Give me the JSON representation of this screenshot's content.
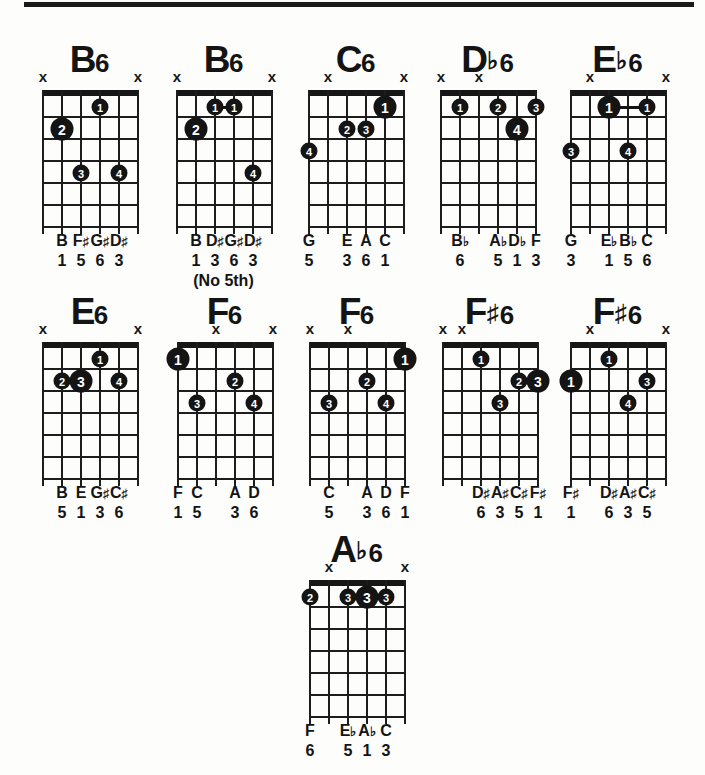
{
  "page": {
    "background": "#fdfdfc",
    "ink_color": "#141414",
    "muted_marker": "x",
    "strings_per_diagram": 6,
    "frets_per_diagram": 6
  },
  "diagrams": [
    {
      "id": "b6-open",
      "title": {
        "letter": "B",
        "accidental": "",
        "suffix": "6"
      },
      "grid_left": 42,
      "top": 42,
      "muted": [
        1,
        6
      ],
      "dots": [
        {
          "string": 4,
          "fret": 1,
          "finger": "1",
          "root": false
        },
        {
          "string": 2,
          "fret": 2,
          "finger": "2",
          "root": true
        },
        {
          "string": 3,
          "fret": 4,
          "finger": "3",
          "root": false
        },
        {
          "string": 5,
          "fret": 4,
          "finger": "4",
          "root": false
        }
      ],
      "barres": [],
      "notes": [
        "",
        "B",
        "F♯",
        "G♯",
        "D♯",
        ""
      ],
      "degrees": [
        "",
        "1",
        "5",
        "6",
        "3",
        ""
      ],
      "note_extra": ""
    },
    {
      "id": "b6-no5th",
      "title": {
        "letter": "B",
        "accidental": "",
        "suffix": "6"
      },
      "grid_left": 176,
      "top": 42,
      "muted": [
        1,
        6
      ],
      "dots": [
        {
          "string": 3,
          "fret": 1,
          "finger": "1",
          "root": false
        },
        {
          "string": 4,
          "fret": 1,
          "finger": "1",
          "root": false
        },
        {
          "string": 2,
          "fret": 2,
          "finger": "2",
          "root": true
        },
        {
          "string": 5,
          "fret": 4,
          "finger": "4",
          "root": false
        }
      ],
      "barres": [
        {
          "fret": 1,
          "from": 3,
          "to": 4
        }
      ],
      "notes": [
        "",
        "B",
        "D♯",
        "G♯",
        "D♯",
        ""
      ],
      "degrees": [
        "",
        "1",
        "3",
        "6",
        "3",
        ""
      ],
      "note_extra": "(No 5th)"
    },
    {
      "id": "c6",
      "title": {
        "letter": "C",
        "accidental": "",
        "suffix": "6"
      },
      "grid_left": 308,
      "top": 42,
      "muted": [
        2,
        6
      ],
      "dots": [
        {
          "string": 5,
          "fret": 1,
          "finger": "1",
          "root": true
        },
        {
          "string": 3,
          "fret": 2,
          "finger": "2",
          "root": false
        },
        {
          "string": 4,
          "fret": 2,
          "finger": "3",
          "root": false
        },
        {
          "string": 1,
          "fret": 3,
          "finger": "4",
          "root": false
        }
      ],
      "barres": [],
      "notes": [
        "G",
        "",
        "E",
        "A",
        "C",
        ""
      ],
      "degrees": [
        "5",
        "",
        "3",
        "6",
        "1",
        ""
      ],
      "note_extra": ""
    },
    {
      "id": "db6",
      "title": {
        "letter": "D",
        "accidental": "♭",
        "suffix": "6"
      },
      "grid_left": 440,
      "top": 42,
      "muted": [
        1,
        3
      ],
      "dots": [
        {
          "string": 2,
          "fret": 1,
          "finger": "1",
          "root": false
        },
        {
          "string": 4,
          "fret": 1,
          "finger": "2",
          "root": false
        },
        {
          "string": 6,
          "fret": 1,
          "finger": "3",
          "root": false
        },
        {
          "string": 5,
          "fret": 2,
          "finger": "4",
          "root": true
        }
      ],
      "barres": [],
      "notes": [
        "",
        "B♭",
        "",
        "A♭",
        "D♭",
        "F"
      ],
      "degrees": [
        "",
        "6",
        "",
        "5",
        "1",
        "3"
      ],
      "note_extra": ""
    },
    {
      "id": "eb6",
      "title": {
        "letter": "E",
        "accidental": "♭",
        "suffix": "6"
      },
      "grid_left": 570,
      "top": 42,
      "muted": [
        2,
        6
      ],
      "dots": [
        {
          "string": 3,
          "fret": 1,
          "finger": "1",
          "root": true
        },
        {
          "string": 5,
          "fret": 1,
          "finger": "1",
          "root": false
        },
        {
          "string": 1,
          "fret": 3,
          "finger": "3",
          "root": false
        },
        {
          "string": 4,
          "fret": 3,
          "finger": "4",
          "root": false
        }
      ],
      "barres": [
        {
          "fret": 1,
          "from": 3,
          "to": 5
        }
      ],
      "notes": [
        "G",
        "",
        "E♭",
        "B♭",
        "C",
        ""
      ],
      "degrees": [
        "3",
        "",
        "1",
        "5",
        "6",
        ""
      ],
      "note_extra": ""
    },
    {
      "id": "e6",
      "title": {
        "letter": "E",
        "accidental": "",
        "suffix": "6"
      },
      "grid_left": 42,
      "top": 294,
      "muted": [
        1,
        6
      ],
      "dots": [
        {
          "string": 4,
          "fret": 1,
          "finger": "1",
          "root": false
        },
        {
          "string": 2,
          "fret": 2,
          "finger": "2",
          "root": false
        },
        {
          "string": 3,
          "fret": 2,
          "finger": "3",
          "root": true
        },
        {
          "string": 5,
          "fret": 2,
          "finger": "4",
          "root": false
        }
      ],
      "barres": [],
      "notes": [
        "",
        "B",
        "E",
        "G♯",
        "C♯",
        ""
      ],
      "degrees": [
        "",
        "5",
        "1",
        "3",
        "6",
        ""
      ],
      "note_extra": ""
    },
    {
      "id": "f6-a",
      "title": {
        "letter": "F",
        "accidental": "",
        "suffix": "6"
      },
      "grid_left": 177,
      "top": 294,
      "muted": [
        3,
        6
      ],
      "dots": [
        {
          "string": 1,
          "fret": 1,
          "finger": "1",
          "root": true
        },
        {
          "string": 4,
          "fret": 2,
          "finger": "2",
          "root": false
        },
        {
          "string": 2,
          "fret": 3,
          "finger": "3",
          "root": false
        },
        {
          "string": 5,
          "fret": 3,
          "finger": "4",
          "root": false
        }
      ],
      "barres": [],
      "notes": [
        "F",
        "C",
        "",
        "A",
        "D",
        ""
      ],
      "degrees": [
        "1",
        "5",
        "",
        "3",
        "6",
        ""
      ],
      "note_extra": ""
    },
    {
      "id": "f6-b",
      "title": {
        "letter": "F",
        "accidental": "",
        "suffix": "6"
      },
      "grid_left": 309,
      "top": 294,
      "muted": [
        1,
        3
      ],
      "dots": [
        {
          "string": 6,
          "fret": 1,
          "finger": "1",
          "root": true
        },
        {
          "string": 4,
          "fret": 2,
          "finger": "2",
          "root": false
        },
        {
          "string": 2,
          "fret": 3,
          "finger": "3",
          "root": false
        },
        {
          "string": 5,
          "fret": 3,
          "finger": "4",
          "root": false
        }
      ],
      "barres": [],
      "notes": [
        "",
        "C",
        "",
        "A",
        "D",
        "F"
      ],
      "degrees": [
        "",
        "5",
        "",
        "3",
        "6",
        "1"
      ],
      "note_extra": ""
    },
    {
      "id": "fsharp6-a",
      "title": {
        "letter": "F",
        "accidental": "♯",
        "suffix": "6"
      },
      "grid_left": 442,
      "top": 294,
      "muted": [
        1,
        2
      ],
      "dots": [
        {
          "string": 3,
          "fret": 1,
          "finger": "1",
          "root": false
        },
        {
          "string": 5,
          "fret": 2,
          "finger": "2",
          "root": false
        },
        {
          "string": 6,
          "fret": 2,
          "finger": "3",
          "root": true
        },
        {
          "string": 4,
          "fret": 3,
          "finger": "3",
          "root": false
        }
      ],
      "barres": [],
      "notes": [
        "",
        "",
        "D♯",
        "A♯",
        "C♯",
        "F♯"
      ],
      "degrees": [
        "",
        "",
        "6",
        "3",
        "5",
        "1"
      ],
      "note_extra": ""
    },
    {
      "id": "fsharp6-b",
      "title": {
        "letter": "F",
        "accidental": "♯",
        "suffix": "6"
      },
      "grid_left": 570,
      "top": 294,
      "muted": [
        2,
        6
      ],
      "dots": [
        {
          "string": 3,
          "fret": 1,
          "finger": "1",
          "root": false
        },
        {
          "string": 1,
          "fret": 2,
          "finger": "1",
          "root": true
        },
        {
          "string": 5,
          "fret": 2,
          "finger": "3",
          "root": false
        },
        {
          "string": 4,
          "fret": 3,
          "finger": "4",
          "root": false
        }
      ],
      "barres": [],
      "notes": [
        "F♯",
        "",
        "D♯",
        "A♯",
        "C♯",
        ""
      ],
      "degrees": [
        "1",
        "",
        "6",
        "3",
        "5",
        ""
      ],
      "note_extra": ""
    },
    {
      "id": "ab6",
      "title": {
        "letter": "A",
        "accidental": "♭",
        "suffix": "6"
      },
      "grid_left": 309,
      "top": 532,
      "muted": [
        2,
        6
      ],
      "dots": [
        {
          "string": 1,
          "fret": 1,
          "finger": "2",
          "root": false
        },
        {
          "string": 3,
          "fret": 1,
          "finger": "3",
          "root": false
        },
        {
          "string": 4,
          "fret": 1,
          "finger": "3",
          "root": true
        },
        {
          "string": 5,
          "fret": 1,
          "finger": "3",
          "root": false
        }
      ],
      "barres": [
        {
          "fret": 1,
          "from": 3,
          "to": 5
        }
      ],
      "notes": [
        "F",
        "",
        "E♭",
        "A♭",
        "C",
        ""
      ],
      "degrees": [
        "6",
        "",
        "5",
        "1",
        "3",
        ""
      ],
      "note_extra": ""
    }
  ]
}
